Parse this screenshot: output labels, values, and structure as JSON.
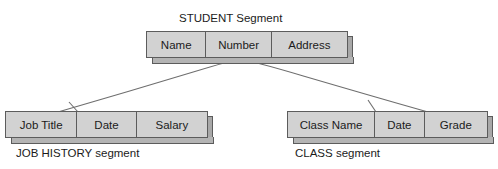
{
  "diagram": {
    "type": "hierarchical-database-segments",
    "title_label": "STUDENT Segment",
    "root": {
      "name": "STUDENT Segment",
      "fields": [
        {
          "label": "Name"
        },
        {
          "label": "Number"
        },
        {
          "label": "Address"
        }
      ]
    },
    "children": [
      {
        "name": "JOB HISTORY segment",
        "caption": "JOB HISTORY segment",
        "fields": [
          {
            "label": "Job Title"
          },
          {
            "label": "Date"
          },
          {
            "label": "Salary"
          }
        ]
      },
      {
        "name": "CLASS segment",
        "caption": "CLASS segment",
        "fields": [
          {
            "label": "Class Name"
          },
          {
            "label": "Date"
          },
          {
            "label": "Grade"
          }
        ]
      }
    ],
    "colors": {
      "box_fill": "#d2d2d2",
      "box_border": "#5c5c5c",
      "side_shade": "#a8a8a8",
      "bottom_shade": "#b4b4b4",
      "connector": "#6e6e6e",
      "text": "#1b1b1b",
      "background": "#ffffff"
    }
  }
}
